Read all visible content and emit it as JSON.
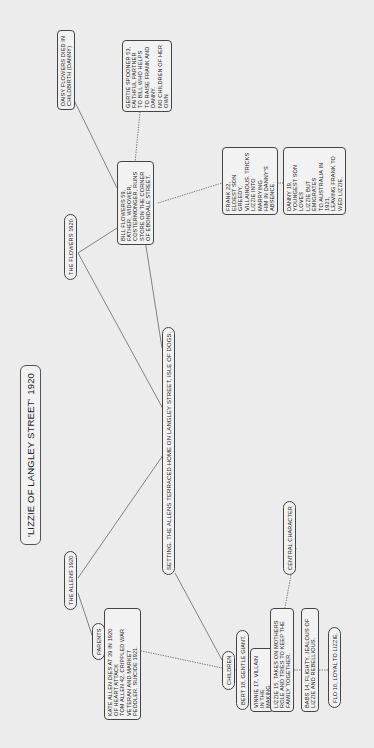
{
  "diagram": {
    "title": {
      "name": "'LIZZIE OF LANGLEY STREET'",
      "year": "1920"
    },
    "setting": "SETTING. THE ALLENS TERRACED HOME ON LANGLEY STREET, ISLE OF DOGS.",
    "allens": {
      "label": "THE ALLENS 1920",
      "parents": {
        "label": "PARENTS",
        "detail": "KATE ALLEN DIES AT 39 IN 1920\nOF HEART ATTACK\nTOM ALLEN 42, CRIPPLED WAR\nVETERAN AND MARKET\nPEDDLER. SUICIDE 1921."
      },
      "children": {
        "label": "CHILDREN",
        "members": [
          "BERT 18, GENTLE GIANT.",
          "VINNIE 17, VILLAIN IN THE\nMAKING",
          "LIZZIE 15, TAKES ON MOTHERS\nROLE AND TRIES TO KEEP THE\nFAMILY TOGETHER.",
          "BABS 14, FLIGHTY, JEALOUS OF\nLIZZIE AND REBELLIOUS.",
          "FLO 10, LOYAL TO LIZZIE."
        ],
        "central_label": "CENTRAL CHARACTER"
      }
    },
    "flowers": {
      "label": "THE FLOWERS 1920",
      "bill": "BILL FLOWERS 59,\nFATHER, WIDOWER,\nCOSTERMONGER, RUNS\nSTORE ON THE CORNER\nOF EBONDALE STREET.",
      "daisy": "DAISY FLOWERS DIED IN\nCHILDBIRTH (DANNY)",
      "gertie": "GERTIE SPOONER 53,\nFAITHFUL PARTNER\nTO BILL WHO HELPS\nTO RAISE FRANK AND\nDANNY.\nNO CHILDREN OF HER\nOWN",
      "frank": "FRANK 22,\nELDEST SON GREEDY,\nVILLAINOUS. TRICKS\nLIZZIE INTO MARRYING\nHIM IN DANNY'S ABSENCE.",
      "danny": "DANNY 19,\nYOUNGEST SON LOVES\nLIZZIE BUT EMIGRATES\nTO AUSTRALIA IN 1921,\nLEAVING FRANK TO\nWED LIZZIE."
    },
    "colors": {
      "background": "#ececec",
      "line": "#555555",
      "node_fill": "#f2f2f2",
      "node_border": "#444444"
    }
  }
}
